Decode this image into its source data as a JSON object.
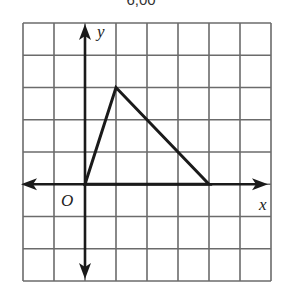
{
  "caption_fragment": "6,00",
  "grid": {
    "columns": 8,
    "rows": 8,
    "left": 23,
    "top": 23,
    "cell_width": 31,
    "cell_height": 32.25,
    "line_color": "#6b6b6b",
    "origin_column": 2,
    "origin_row": 5
  },
  "axes": {
    "x_label": "x",
    "y_label": "y",
    "origin_label": "O",
    "color": "#1a1a1a"
  },
  "triangle": {
    "vertices": [
      {
        "name": "O",
        "x": 0,
        "y": 0
      },
      {
        "name": "apex",
        "x": 1,
        "y": 3
      },
      {
        "name": "base-right",
        "x": 4,
        "y": 0
      }
    ],
    "stroke": "#1a1a1a"
  }
}
